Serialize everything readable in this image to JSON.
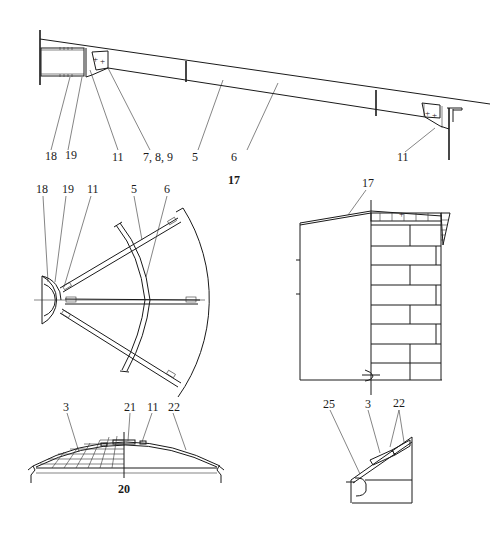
{
  "figures": {
    "fig17": {
      "number": "17",
      "labels": [
        "18",
        "19",
        "11",
        "7, 8, 9",
        "5",
        "6",
        "11"
      ]
    },
    "plan": {
      "labels": [
        "18",
        "19",
        "11",
        "5",
        "6"
      ]
    },
    "elevation": {
      "labels": [
        "17"
      ]
    },
    "fig20": {
      "number": "20",
      "labels": [
        "3",
        "21",
        "11",
        "22"
      ]
    },
    "detail": {
      "labels": [
        "25",
        "3",
        "22"
      ]
    }
  }
}
